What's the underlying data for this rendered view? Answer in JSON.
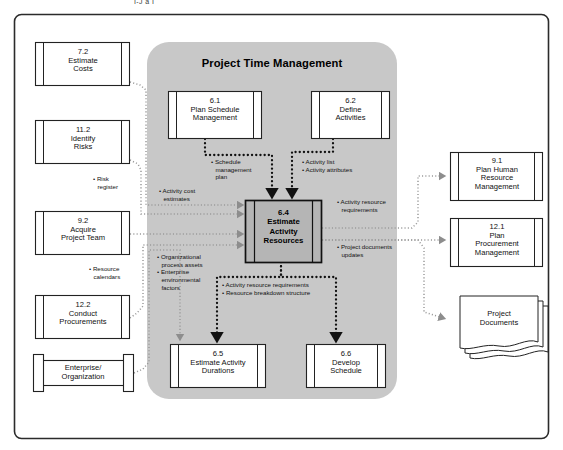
{
  "figure": {
    "top_fragment": "I-J    a   I",
    "panel_title": "Project Time Management",
    "panel_color": "#c8c8c8",
    "border_color": "#2b2b2b",
    "center_box_fill": "#b5b5b5"
  },
  "center_process": {
    "number": "6.4",
    "line1": "Estimate",
    "line2": "Activity",
    "line3": "Resources"
  },
  "inside_processes": [
    {
      "id": "p61",
      "number": "6.1",
      "lines": [
        "Plan Schedule",
        "Management"
      ]
    },
    {
      "id": "p62",
      "number": "6.2",
      "lines": [
        "Define",
        "Activities"
      ]
    },
    {
      "id": "p65",
      "number": "6.5",
      "lines": [
        "Estimate Activity",
        "Durations"
      ]
    },
    {
      "id": "p66",
      "number": "6.6",
      "lines": [
        "Develop",
        "Schedule"
      ]
    }
  ],
  "left_processes": [
    {
      "id": "p72",
      "number": "7.2",
      "lines": [
        "Estimate",
        "Costs"
      ]
    },
    {
      "id": "p112",
      "number": "11.2",
      "lines": [
        "Identify",
        "Risks"
      ]
    },
    {
      "id": "p92",
      "number": "9.2",
      "lines": [
        "Acquire",
        "Project Team"
      ]
    },
    {
      "id": "p122",
      "number": "12.2",
      "lines": [
        "Conduct",
        "Procurements"
      ]
    }
  ],
  "right_processes": [
    {
      "id": "p91",
      "number": "9.1",
      "lines": [
        "Plan Human",
        "Resource",
        "Management"
      ]
    },
    {
      "id": "p121",
      "number": "12.1",
      "lines": [
        "Plan",
        "Procurement",
        "Management"
      ]
    }
  ],
  "datastores": [
    {
      "id": "ds-enterprise",
      "lines": [
        "Enterprise/",
        "Organization"
      ]
    }
  ],
  "documents": [
    {
      "id": "doc-project",
      "lines": [
        "Project",
        "Documents"
      ]
    }
  ],
  "flow_labels": {
    "schedule_management_plan": [
      "Schedule",
      "management",
      "plan"
    ],
    "activity_list_attributes": [
      "Activity list",
      "Activity attributes"
    ],
    "activity_cost_estimates": [
      "Activity cost",
      "estimates"
    ],
    "risk_register": [
      "Risk",
      "register"
    ],
    "resource_calendars": [
      "Resource",
      "calendars"
    ],
    "opa_eef": [
      "Organizational",
      "process assets",
      "Enterprise",
      "environmental",
      "factors"
    ],
    "activity_resource_requirements_right": [
      "Activity resource",
      "requirements"
    ],
    "project_documents_updates": [
      "Project documents",
      "updates"
    ],
    "arr_rbs": [
      "Activity resource requirements",
      "Resource breakdown structure"
    ]
  }
}
